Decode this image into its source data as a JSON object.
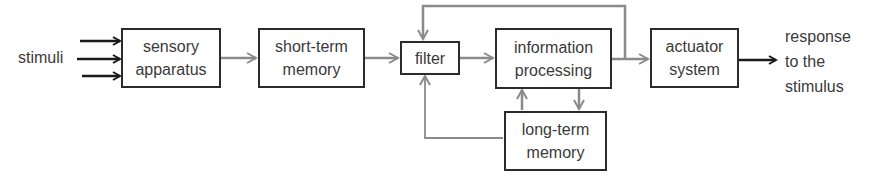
{
  "diagram": {
    "input_label": "stimuli",
    "output_label": "response\nto the\nstimulus",
    "nodes": {
      "sensory": "sensory\napparatus",
      "short_term": "short-term\nmemory",
      "filter": "filter",
      "processing": "information\nprocessing",
      "actuator": "actuator\nsystem",
      "long_term": "long-term\nmemory"
    },
    "edges": [
      {
        "from": "stimuli",
        "to": "sensory apparatus",
        "count": 3,
        "color": "#1a1a1a"
      },
      {
        "from": "sensory apparatus",
        "to": "short-term memory",
        "color": "#8a8a8a"
      },
      {
        "from": "short-term memory",
        "to": "filter",
        "color": "#8a8a8a"
      },
      {
        "from": "filter",
        "to": "information processing",
        "color": "#8a8a8a"
      },
      {
        "from": "information processing",
        "to": "actuator system",
        "color": "#8a8a8a"
      },
      {
        "from": "information processing output",
        "to": "filter",
        "type": "feedback-top",
        "color": "#8a8a8a"
      },
      {
        "from": "information processing",
        "to": "long-term memory",
        "color": "#8a8a8a"
      },
      {
        "from": "long-term memory",
        "to": "information processing",
        "color": "#8a8a8a"
      },
      {
        "from": "long-term memory",
        "to": "filter",
        "type": "feedback-bottom",
        "color": "#8a8a8a"
      },
      {
        "from": "actuator system",
        "to": "response to the stimulus",
        "color": "#1a1a1a"
      }
    ],
    "colors": {
      "box_border": "#2b2b2b",
      "text": "#3a3a3a",
      "grey_arrow": "#8a8a8a",
      "black_arrow": "#1a1a1a"
    }
  }
}
